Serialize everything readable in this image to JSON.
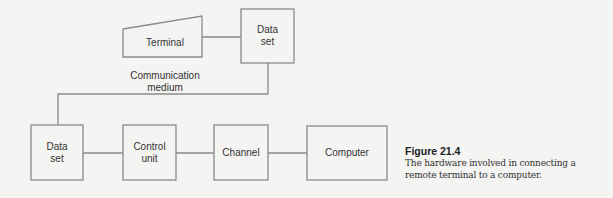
{
  "diagram": {
    "nodes": {
      "terminal": {
        "label": "Terminal"
      },
      "data_set_remote": {
        "label": "Data\nset",
        "line1": "Data",
        "line2": "set"
      },
      "data_set_local": {
        "label": "Data\nset",
        "line1": "Data",
        "line2": "set"
      },
      "control_unit": {
        "label": "Control\nunit",
        "line1": "Control",
        "line2": "unit"
      },
      "channel": {
        "label": "Channel"
      },
      "computer": {
        "label": "Computer"
      }
    },
    "edges": [
      {
        "from": "terminal",
        "to": "data_set_remote"
      },
      {
        "from": "data_set_remote",
        "to": "data_set_local",
        "label": "Communication medium"
      },
      {
        "from": "data_set_local",
        "to": "control_unit"
      },
      {
        "from": "control_unit",
        "to": "channel"
      },
      {
        "from": "channel",
        "to": "computer"
      }
    ],
    "medium_label": {
      "line1": "Communication",
      "line2": "medium"
    },
    "stroke_color": "#8a8a8a"
  },
  "caption": {
    "title": "Figure 21.4",
    "text": "The hardware involved in connecting a remote terminal to a computer."
  }
}
